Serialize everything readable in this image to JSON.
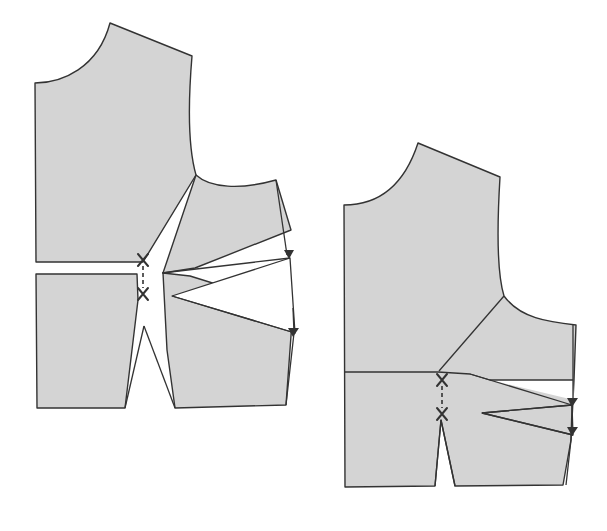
{
  "diagram": {
    "title": "",
    "colors": {
      "fabric_fill": "#d4d4d4",
      "outline": "#333333",
      "background": "#ffffff"
    },
    "figures": [
      {
        "id": "left-figure",
        "label": "",
        "pieces": [
          "upper-bodice",
          "lower-center-panel",
          "side-panel-rotated"
        ],
        "markers": [
          "cross-mark-top",
          "cross-mark-bottom",
          "arrow-upper",
          "arrow-lower"
        ]
      },
      {
        "id": "right-figure",
        "label": "",
        "pieces": [
          "bodice-closed"
        ],
        "markers": [
          "cross-mark-top",
          "cross-mark-bottom",
          "arrow-upper",
          "arrow-lower"
        ]
      }
    ],
    "text_labels": []
  }
}
